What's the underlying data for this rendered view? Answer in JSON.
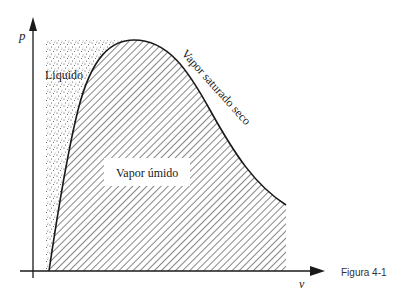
{
  "figure": {
    "caption": "Figura 4-1",
    "axes": {
      "y_label": "p",
      "x_label": "v"
    },
    "regions": {
      "liquid_label": "Liquido",
      "wet_vapor_label": "Vapor úmido",
      "dry_saturated_vapor_label": "Vapor saturado seco"
    },
    "colors": {
      "ink": "#1a1a1a",
      "background": "#ffffff"
    }
  }
}
